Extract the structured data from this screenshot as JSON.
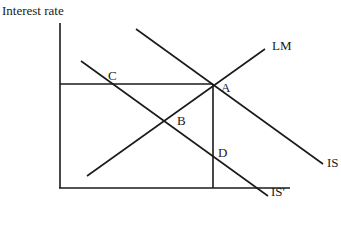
{
  "diagram": {
    "type": "IS-LM model",
    "y_axis_label": "Interest rate",
    "curves": [
      {
        "name": "LM",
        "label": "LM",
        "x1": 87,
        "y1": 176,
        "x2": 265,
        "y2": 49,
        "label_x": 272,
        "label_y": 50
      },
      {
        "name": "IS",
        "label": "IS",
        "x1": 136,
        "y1": 29,
        "x2": 323,
        "y2": 164,
        "label_x": 327,
        "label_y": 167
      },
      {
        "name": "IS-prime",
        "label": "IS'",
        "x1": 81,
        "y1": 61,
        "x2": 268,
        "y2": 196,
        "label_x": 271,
        "label_y": 196
      }
    ],
    "points": [
      {
        "label": "A",
        "x": 221,
        "y": 92
      },
      {
        "label": "B",
        "x": 177,
        "y": 125
      },
      {
        "label": "C",
        "x": 108,
        "y": 80
      },
      {
        "label": "D",
        "x": 218,
        "y": 157
      }
    ],
    "guides": {
      "horizontal": {
        "x1": 60,
        "y1": 84,
        "x2": 213,
        "y2": 84
      },
      "vertical": {
        "x1": 213,
        "y1": 84,
        "x2": 213,
        "y2": 188
      }
    },
    "axes": {
      "y": {
        "x1": 60,
        "y1": 23,
        "x2": 60,
        "y2": 188
      },
      "x": {
        "x1": 59,
        "y1": 188,
        "x2": 290,
        "y2": 188
      }
    }
  }
}
